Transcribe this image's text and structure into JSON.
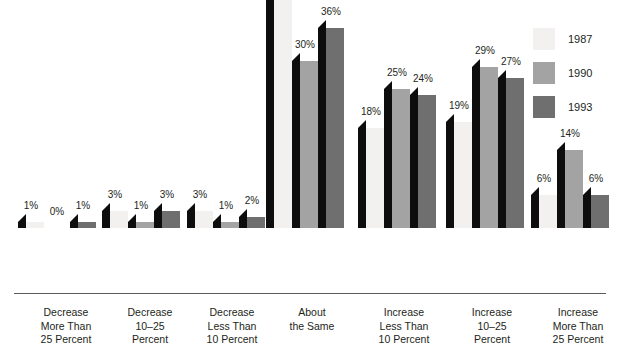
{
  "chart_data": {
    "type": "bar",
    "title": "",
    "subtitle": "",
    "xlabel": "",
    "ylabel": "",
    "ylim": [
      0,
      46
    ],
    "grid": false,
    "legend_position": "top-right",
    "categories": [
      "Decrease More Than 25 Percent",
      "Decrease 10–25 Percent",
      "Decrease Less Than 10 Percent",
      "About the Same",
      "Increase Less Than 10 Percent",
      "Increase 10–25 Percent",
      "Increase More Than 25 Percent"
    ],
    "category_lines": [
      [
        "Decrease",
        "More Than",
        "25 Percent"
      ],
      [
        "Decrease",
        "10–25",
        "Percent"
      ],
      [
        "Decrease",
        "Less Than",
        "10 Percent"
      ],
      [
        "About",
        "the Same"
      ],
      [
        "Increase",
        "Less Than",
        "10 Percent"
      ],
      [
        "Increase",
        "10–25",
        "Percent"
      ],
      [
        "Increase",
        "More Than",
        "25 Percent"
      ]
    ],
    "series": [
      {
        "name": "1987",
        "color": "#f2f1ef",
        "values": [
          1,
          3,
          3,
          46,
          18,
          19,
          6
        ]
      },
      {
        "name": "1990",
        "color": "#a3a3a3",
        "values": [
          0,
          1,
          1,
          30,
          25,
          29,
          14
        ]
      },
      {
        "name": "1993",
        "color": "#6f6f6f",
        "values": [
          1,
          3,
          2,
          36,
          24,
          27,
          6
        ]
      }
    ],
    "value_labels": [
      [
        "1%",
        "0%",
        "1%"
      ],
      [
        "3%",
        "1%",
        "3%"
      ],
      [
        "3%",
        "1%",
        "2%"
      ],
      [
        "46%",
        "30%",
        "36%"
      ],
      [
        "18%",
        "25%",
        "24%"
      ],
      [
        "19%",
        "29%",
        "27%"
      ],
      [
        "6%",
        "14%",
        "6%"
      ]
    ]
  },
  "legend": {
    "items": [
      {
        "label": "1987",
        "color": "#f2f1ef"
      },
      {
        "label": "1990",
        "color": "#a3a3a3"
      },
      {
        "label": "1993",
        "color": "#6f6f6f"
      }
    ]
  },
  "colors": {
    "series_1987": "#f2f1ef",
    "series_1990": "#a3a3a3",
    "series_1993": "#6f6f6f",
    "bar_shadow": "#0d0d0d",
    "axis": "#5b5b5b",
    "text": "#231f20",
    "background": "#ffffff"
  }
}
